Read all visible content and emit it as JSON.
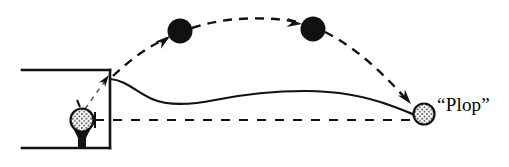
{
  "figure": {
    "type": "golf-shot-trajectory-diagram",
    "background_color": "#ffffff",
    "ink_color": "#111111",
    "width": 509,
    "height": 167,
    "annotations": {
      "plop_label": "“Plop”"
    },
    "elements": {
      "tee_box": {
        "name": "tee-box",
        "description": "open rectangle drawn with top, right and bottom edges",
        "left": 22,
        "top": 70,
        "right": 110,
        "bottom": 148,
        "stroke_width": 2.4
      },
      "teed_ball": {
        "name": "golf-ball-on-tee",
        "cx": 82,
        "cy": 120,
        "r": 11,
        "fill": "#ffffff",
        "dimpled": true
      },
      "tee_peg": {
        "name": "golf-tee-peg",
        "cx": 82,
        "top": 128,
        "bottom": 148
      },
      "flight_ball_1": {
        "name": "flight-ball-1",
        "cx": 180,
        "cy": 31,
        "r": 12,
        "fill": "#111111"
      },
      "flight_ball_2": {
        "name": "flight-ball-2",
        "cx": 313,
        "cy": 29,
        "r": 12,
        "fill": "#111111"
      },
      "landing_ball": {
        "name": "landing-golf-ball",
        "cx": 424,
        "cy": 114,
        "r": 10,
        "fill": "#ffffff",
        "dimpled": true
      },
      "trajectory_arc": {
        "name": "ball-flight-trajectory",
        "style": "dashed",
        "dash": "9 7",
        "stroke_width": 2.4,
        "start": [
          114,
          76
        ],
        "apex": [
          250,
          18
        ],
        "end": [
          420,
          108
        ]
      },
      "terrain_curve": {
        "name": "terrain-profile-curve",
        "style": "solid",
        "stroke_width": 2.2,
        "start": [
          110,
          80
        ],
        "end": [
          424,
          118
        ]
      },
      "reference_line": {
        "name": "horizontal-reference-line",
        "style": "dashed",
        "dash": "9 9",
        "stroke_width": 2.2,
        "y": 120,
        "x_start": 95,
        "x_end": 418
      },
      "tee_pointer": {
        "name": "tee-to-corner-dashed-pointer",
        "style": "dashed-faint",
        "from": [
          86,
          108
        ],
        "to": [
          108,
          76
        ]
      },
      "arrows": [
        {
          "name": "arrowhead-ascending",
          "x": 166,
          "y": 40,
          "angle": -37
        },
        {
          "name": "arrowhead-apex",
          "x": 299,
          "y": 29,
          "angle": -2
        },
        {
          "name": "arrowhead-descending",
          "x": 409,
          "y": 101,
          "angle": 52
        },
        {
          "name": "arrowhead-tee-box-corner",
          "x": 108,
          "y": 76,
          "angle": -50
        }
      ]
    }
  }
}
